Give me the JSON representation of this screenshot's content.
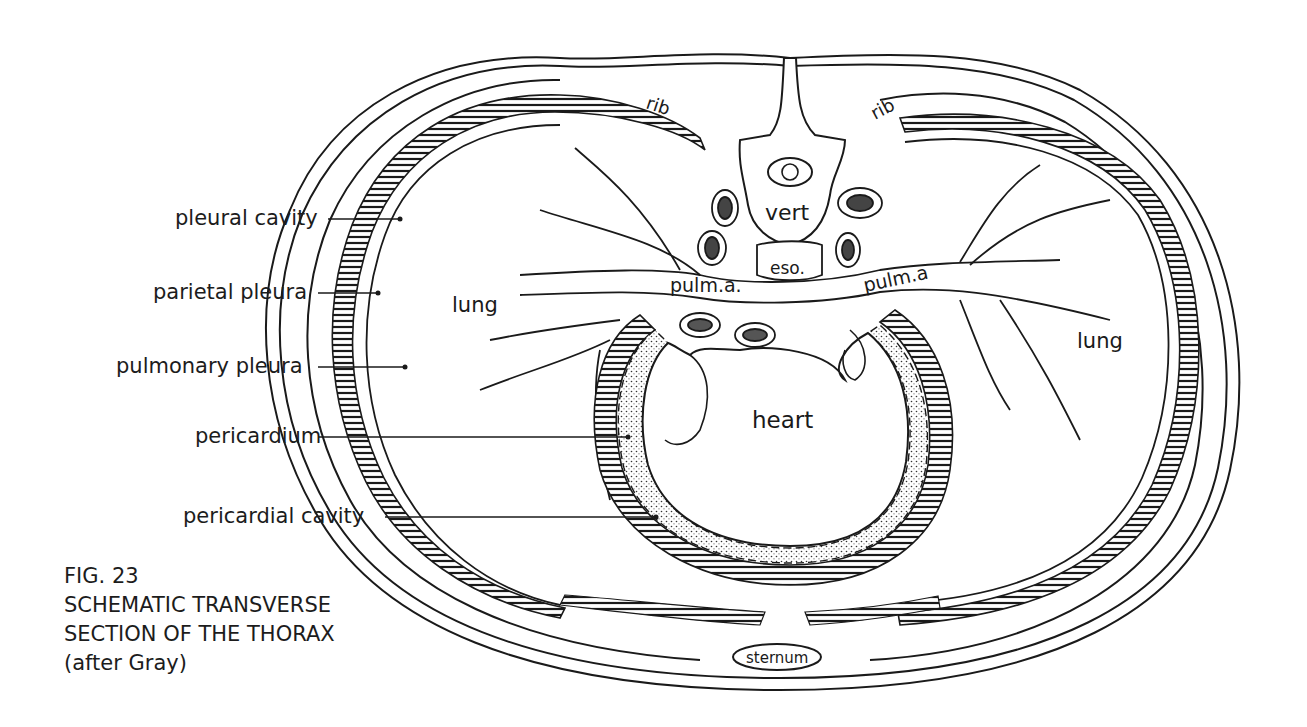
{
  "figure": {
    "number": "FIG. 23",
    "title_line1": "SCHEMATIC TRANSVERSE",
    "title_line2": "SECTION OF THE THORAX",
    "attribution": "(after Gray)"
  },
  "callouts": [
    {
      "label": "pleural cavity"
    },
    {
      "label": "parietal pleura"
    },
    {
      "label": "pulmonary pleura"
    },
    {
      "label": "pericardium"
    },
    {
      "label": "pericardial cavity"
    }
  ],
  "structures": {
    "rib_left": "rib",
    "rib_right": "rib",
    "vertebra": "vert",
    "esophagus": "eso.",
    "pulm_artery_left": "pulm.a.",
    "pulm_artery_right": "pulm.a",
    "lung_left": "lung",
    "lung_right": "lung",
    "heart": "heart",
    "sternum": "sternum"
  },
  "colors": {
    "ink": "#1a1a1a",
    "paper": "#ffffff"
  }
}
